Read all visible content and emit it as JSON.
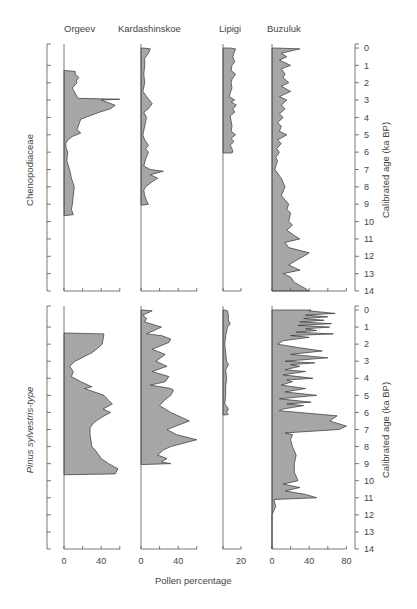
{
  "chart_data": {
    "type": "area",
    "title": "",
    "xlabel": "Pollen percentage",
    "ylabel": "Calibrated age (ka BP)",
    "sites": [
      "Orgeev",
      "Kardashinskoe",
      "Lipigi",
      "Buzuluk"
    ],
    "panels": [
      "Chenopodiaceae",
      "Pinus sylvestris-type"
    ],
    "age_ticks": [
      0,
      1,
      2,
      3,
      4,
      5,
      6,
      7,
      8,
      9,
      10,
      11,
      12,
      13,
      14
    ],
    "x_ticks": {
      "Orgeev": {
        "labels": [
          "0",
          "40"
        ],
        "range": [
          0,
          60
        ]
      },
      "Kardashinskoe": {
        "labels": [
          "0",
          "40"
        ],
        "range": [
          0,
          60
        ]
      },
      "Lipigi": {
        "labels": [
          "20"
        ],
        "range": [
          0,
          20
        ]
      },
      "Buzuluk": {
        "labels": [
          "0",
          "40",
          "80"
        ],
        "range": [
          0,
          80
        ]
      }
    },
    "series": [
      {
        "panel": "Chenopodiaceae",
        "site": "Orgeev",
        "age": [
          1.3,
          1.35,
          1.5,
          1.7,
          1.9,
          2.0,
          2.3,
          2.4,
          2.9,
          2.95,
          3.0,
          3.3,
          3.5,
          3.7,
          4.1,
          4.7,
          4.9,
          5.1,
          5.3,
          5.5,
          5.7,
          6.0,
          6.5,
          7.0,
          7.5,
          8.0,
          8.5,
          9.0,
          9.3,
          9.6,
          9.65
        ],
        "values": [
          2,
          12,
          12,
          16,
          13,
          14,
          9,
          10,
          15,
          60,
          40,
          55,
          50,
          38,
          18,
          14,
          18,
          9,
          4,
          2,
          2,
          4,
          3,
          6,
          8,
          11,
          10,
          9,
          8,
          10,
          2
        ]
      },
      {
        "panel": "Chenopodiaceae",
        "site": "Kardashinskoe",
        "age": [
          0,
          0.05,
          0.3,
          0.6,
          1.0,
          1.5,
          2.0,
          2.5,
          2.8,
          3.0,
          3.2,
          3.5,
          3.7,
          4.0,
          4.5,
          5.0,
          5.3,
          5.6,
          5.8,
          6.0,
          6.4,
          6.8,
          7.0,
          7.1,
          7.3,
          7.5,
          7.7,
          8.0,
          8.2,
          8.5,
          8.8,
          9.0,
          9.05
        ],
        "values": [
          2,
          10,
          8,
          4,
          4,
          3,
          4,
          2,
          6,
          9,
          12,
          8,
          3,
          6,
          4,
          2,
          4,
          8,
          5,
          8,
          5,
          3,
          10,
          24,
          10,
          18,
          12,
          5,
          3,
          4,
          6,
          8,
          2
        ]
      },
      {
        "panel": "Chenopodiaceae",
        "site": "Lipigi",
        "age": [
          0,
          0.05,
          0.3,
          0.5,
          0.8,
          1.0,
          1.3,
          1.5,
          1.8,
          2.0,
          2.3,
          2.6,
          2.8,
          2.9,
          3.0,
          3.1,
          3.3,
          3.5,
          3.7,
          3.9,
          4.2,
          4.5,
          4.8,
          5.0,
          5.2,
          5.4,
          5.6,
          5.8,
          6.0,
          6.05
        ],
        "values": [
          8,
          14,
          12,
          11,
          13,
          10,
          9,
          14,
          10,
          9,
          10,
          8,
          7,
          10,
          13,
          9,
          15,
          11,
          13,
          8,
          9,
          10,
          9,
          14,
          9,
          12,
          8,
          10,
          11,
          9
        ]
      },
      {
        "panel": "Chenopodiaceae",
        "site": "Buzuluk",
        "age": [
          0,
          0.05,
          0.3,
          0.5,
          0.7,
          1.0,
          1.2,
          1.5,
          1.7,
          2.0,
          2.2,
          2.5,
          2.8,
          3.0,
          3.3,
          3.5,
          3.8,
          4.0,
          4.3,
          4.5,
          4.8,
          5.0,
          5.3,
          5.5,
          5.8,
          6.0,
          6.3,
          6.5,
          7.0,
          7.5,
          8.0,
          8.5,
          9.0,
          9.3,
          9.5,
          10.0,
          10.2,
          10.5,
          10.8,
          11.0,
          11.2,
          11.5,
          11.8,
          12.0,
          12.3,
          12.5,
          12.8,
          13.0,
          13.2,
          13.5,
          13.8,
          14.0
        ],
        "values": [
          2,
          30,
          10,
          16,
          8,
          20,
          10,
          14,
          12,
          18,
          10,
          20,
          8,
          16,
          10,
          14,
          8,
          12,
          6,
          10,
          8,
          16,
          6,
          10,
          5,
          8,
          4,
          6,
          3,
          10,
          14,
          10,
          18,
          16,
          20,
          18,
          22,
          16,
          24,
          30,
          14,
          18,
          40,
          34,
          24,
          18,
          30,
          12,
          20,
          24,
          34,
          40
        ]
      },
      {
        "panel": "Pinus sylvestris-type",
        "site": "Orgeev",
        "age": [
          1.35,
          1.4,
          2.0,
          2.3,
          2.5,
          3.0,
          3.3,
          3.6,
          3.9,
          4.2,
          4.5,
          4.6,
          5.0,
          5.3,
          5.5,
          5.8,
          6.0,
          6.3,
          6.6,
          6.9,
          7.3,
          8.0,
          8.3,
          8.7,
          9.0,
          9.3,
          9.6,
          9.65
        ],
        "values": [
          2,
          43,
          41,
          35,
          30,
          12,
          6,
          10,
          8,
          18,
          30,
          22,
          43,
          48,
          52,
          42,
          50,
          40,
          32,
          28,
          28,
          30,
          35,
          40,
          48,
          58,
          55,
          2
        ]
      },
      {
        "panel": "Pinus sylvestris-type",
        "site": "Kardashinskoe",
        "age": [
          0,
          0.05,
          0.2,
          0.3,
          0.5,
          0.7,
          1.0,
          1.4,
          1.5,
          1.7,
          1.9,
          2.3,
          2.6,
          3.0,
          3.3,
          3.6,
          3.9,
          4.2,
          4.4,
          4.6,
          4.7,
          5.0,
          5.3,
          5.6,
          6.0,
          6.5,
          7.0,
          7.3,
          7.6,
          8.0,
          8.2,
          8.5,
          8.7,
          8.9,
          9.0,
          9.05
        ],
        "values": [
          2,
          12,
          6,
          2,
          6,
          4,
          22,
          6,
          22,
          32,
          30,
          12,
          26,
          16,
          28,
          12,
          30,
          26,
          10,
          32,
          35,
          32,
          25,
          20,
          32,
          52,
          28,
          38,
          60,
          32,
          24,
          18,
          28,
          22,
          32,
          2
        ]
      },
      {
        "panel": "Pinus sylvestris-type",
        "site": "Lipigi",
        "age": [
          0,
          0.05,
          0.3,
          0.6,
          0.8,
          1.0,
          1.5,
          2.0,
          2.5,
          3.0,
          3.2,
          3.5,
          4.0,
          4.5,
          5.0,
          5.5,
          5.8,
          6.0,
          6.1,
          6.15
        ],
        "values": [
          2,
          5,
          6,
          6,
          8,
          5,
          3,
          2,
          3,
          4,
          6,
          3,
          4,
          3,
          3,
          2,
          6,
          4,
          6,
          2
        ]
      },
      {
        "panel": "Pinus sylvestris-type",
        "site": "Buzuluk",
        "age": [
          0,
          0.05,
          0.2,
          0.3,
          0.4,
          0.5,
          0.6,
          0.7,
          0.8,
          0.9,
          1.0,
          1.1,
          1.2,
          1.3,
          1.4,
          1.5,
          1.6,
          1.8,
          2.0,
          2.2,
          2.4,
          2.6,
          2.8,
          3.0,
          3.1,
          3.2,
          3.3,
          3.5,
          3.6,
          3.8,
          4.0,
          4.1,
          4.2,
          4.4,
          4.6,
          4.8,
          5.0,
          5.2,
          5.4,
          5.5,
          5.6,
          5.8,
          5.9,
          6.2,
          6.5,
          6.8,
          7.0,
          7.2,
          7.3,
          7.6,
          8.0,
          8.5,
          9.0,
          9.5,
          10.0,
          10.2,
          10.4,
          10.6,
          10.8,
          11.0,
          11.1,
          11.5,
          12.0,
          14.0
        ],
        "values": [
          42,
          40,
          68,
          36,
          60,
          34,
          56,
          30,
          64,
          28,
          62,
          36,
          48,
          26,
          66,
          20,
          40,
          12,
          6,
          28,
          54,
          20,
          60,
          14,
          46,
          20,
          30,
          14,
          36,
          12,
          44,
          16,
          22,
          10,
          36,
          14,
          48,
          8,
          42,
          16,
          34,
          12,
          8,
          70,
          62,
          80,
          72,
          14,
          22,
          20,
          22,
          26,
          24,
          24,
          28,
          12,
          30,
          14,
          36,
          48,
          2,
          4,
          0,
          0
        ]
      }
    ]
  },
  "header": {
    "site_labels": [
      "Orgeev",
      "Kardashinskoe",
      "Lipigi",
      "Buzuluk"
    ]
  },
  "panels": {
    "top_label": "Chenopodiaceae",
    "bottom_label": "Pinus sylvestris-type"
  },
  "axes": {
    "age_label": "Calibrated age (ka BP)",
    "pollen_label": "Pollen percentage",
    "age_ticks": [
      "0",
      "1",
      "2",
      "3",
      "4",
      "5",
      "6",
      "7",
      "8",
      "9",
      "10",
      "11",
      "12",
      "13",
      "14"
    ],
    "orgeev_ticks": [
      "0",
      "40"
    ],
    "kardashinskoe_ticks": [
      "0",
      "40"
    ],
    "lipigi_ticks": [
      "20"
    ],
    "buzuluk_ticks": [
      "0",
      "40",
      "80"
    ]
  },
  "colors": {
    "fill": "#a6a6a6",
    "stroke": "#333333",
    "axis": "#555555"
  }
}
